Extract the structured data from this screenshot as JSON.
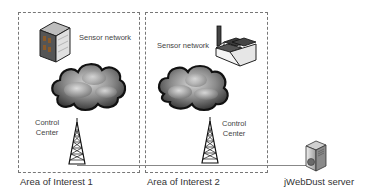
{
  "diagram": {
    "areas": [
      {
        "label": "Area of Interest 1",
        "sensor_network_label": "Sensor network",
        "control_center_label_line1": "Control",
        "control_center_label_line2": "Center",
        "sensor_icon": "building-icon"
      },
      {
        "label": "Area of Interest 2",
        "sensor_network_label": "Sensor network",
        "control_center_label_line1": "Control",
        "control_center_label_line2": "Center",
        "sensor_icon": "factory-icon"
      }
    ],
    "server": {
      "label": "jWebDust server",
      "icon": "server-icon"
    },
    "colors": {
      "dashed_border": "#777777",
      "link_line": "#888888",
      "cloud_dark": "#333333",
      "cloud_light": "#c8c8c8"
    }
  }
}
